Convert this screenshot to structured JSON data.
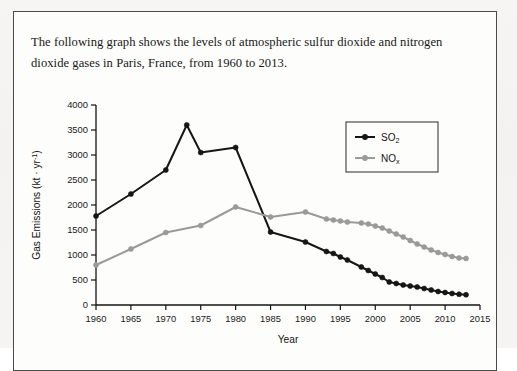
{
  "prompt": {
    "text": "The following graph shows the levels of atmospheric sulfur dioxide and nitrogen dioxide gases in Paris, France, from 1960 to 2013."
  },
  "legend": {
    "entries": [
      {
        "label": "SO2",
        "base": "SO",
        "sub": "2",
        "color": "#161616"
      },
      {
        "label": "NOx",
        "base": "NO",
        "sub": "x",
        "color": "#9a9a9a"
      }
    ]
  },
  "axes": {
    "x_label": "Year",
    "y_label_base": "Gas Emissions (kt · yr",
    "y_label_sup": "-1",
    "y_label_tail": ")",
    "x_ticks": [
      "1960",
      "1965",
      "1970",
      "1975",
      "1980",
      "1985",
      "1990",
      "1995",
      "2000",
      "2005",
      "2010",
      "2015"
    ],
    "y_ticks": [
      "0",
      "500",
      "1000",
      "1500",
      "2000",
      "2500",
      "3000",
      "3500",
      "4000"
    ]
  },
  "chart_data": {
    "type": "line",
    "title": "",
    "xlabel": "Year",
    "ylabel": "Gas Emissions (kt · yr^-1)",
    "xlim": [
      1960,
      2015
    ],
    "ylim": [
      0,
      4000
    ],
    "grid": false,
    "legend_position": "top-right",
    "series": [
      {
        "name": "SO2",
        "color": "#161616",
        "x": [
          1960,
          1965,
          1970,
          1973,
          1975,
          1980,
          1985,
          1990,
          1993,
          1994,
          1995,
          1996,
          1998,
          1999,
          2000,
          2001,
          2002,
          2003,
          2004,
          2005,
          2006,
          2007,
          2008,
          2009,
          2010,
          2011,
          2012,
          2013
        ],
        "y": [
          1780,
          2220,
          2700,
          3600,
          3050,
          3150,
          1460,
          1260,
          1070,
          1030,
          960,
          900,
          760,
          690,
          620,
          550,
          460,
          430,
          400,
          380,
          360,
          330,
          300,
          270,
          250,
          230,
          215,
          205
        ]
      },
      {
        "name": "NOx",
        "color": "#9a9a9a",
        "x": [
          1960,
          1965,
          1970,
          1975,
          1980,
          1985,
          1990,
          1993,
          1994,
          1995,
          1996,
          1998,
          1999,
          2000,
          2001,
          2002,
          2003,
          2004,
          2005,
          2006,
          2007,
          2008,
          2009,
          2010,
          2011,
          2012,
          2013
        ],
        "y": [
          800,
          1120,
          1450,
          1590,
          1960,
          1760,
          1860,
          1720,
          1700,
          1680,
          1660,
          1640,
          1620,
          1580,
          1540,
          1480,
          1420,
          1360,
          1290,
          1220,
          1160,
          1100,
          1050,
          1010,
          970,
          940,
          930
        ]
      }
    ]
  }
}
